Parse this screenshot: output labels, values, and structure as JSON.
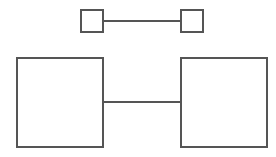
{
  "canvas": {
    "width": 276,
    "height": 157,
    "background": "#ffffff"
  },
  "style": {
    "stroke_color": "#555555",
    "fill_color": "#ffffff",
    "node_stroke_width": 2,
    "edge_stroke_width": 2
  },
  "diagram": {
    "title": "",
    "type": "node-link",
    "node_count": 4,
    "edge_count": 2
  },
  "nodes": [
    {
      "id": "small-left",
      "label": "",
      "x": 81,
      "y": 10,
      "width": 22,
      "height": 22,
      "stroke": "#555555",
      "fill": "#ffffff",
      "stroke_width": 2
    },
    {
      "id": "small-right",
      "label": "",
      "x": 181,
      "y": 10,
      "width": 22,
      "height": 22,
      "stroke": "#555555",
      "fill": "#ffffff",
      "stroke_width": 2
    },
    {
      "id": "large-left",
      "label": "",
      "x": 17,
      "y": 58,
      "width": 86,
      "height": 89,
      "stroke": "#555555",
      "fill": "#ffffff",
      "stroke_width": 2
    },
    {
      "id": "large-right",
      "label": "",
      "x": 181,
      "y": 58,
      "width": 86,
      "height": 89,
      "stroke": "#555555",
      "fill": "#ffffff",
      "stroke_width": 2
    }
  ],
  "edges": [
    {
      "id": "edge-top",
      "label": "",
      "from": "small-left",
      "to": "small-right",
      "x1": 102,
      "y1": 21,
      "x2": 182,
      "y2": 21,
      "stroke": "#555555",
      "stroke_width": 2
    },
    {
      "id": "edge-bottom",
      "label": "",
      "from": "large-left",
      "to": "large-right",
      "x1": 102,
      "y1": 102,
      "x2": 182,
      "y2": 102,
      "stroke": "#555555",
      "stroke_width": 2
    }
  ]
}
